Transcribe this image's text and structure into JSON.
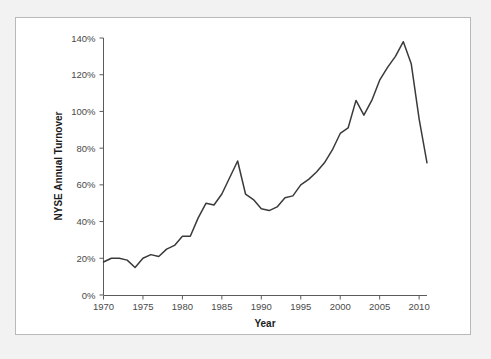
{
  "chart_data": {
    "type": "line",
    "title": "",
    "xlabel": "Year",
    "ylabel": "NYSE Annual Turnover",
    "xlim": [
      1970,
      2011
    ],
    "ylim": [
      0,
      140
    ],
    "grid": false,
    "legend": null,
    "xticks": [
      1970,
      1975,
      1980,
      1985,
      1990,
      1995,
      2000,
      2005,
      2010
    ],
    "xtick_labels": [
      "1970",
      "1975",
      "1980",
      "1985",
      "1990",
      "1995",
      "2000",
      "2005",
      "2010"
    ],
    "yticks": [
      0,
      20,
      40,
      60,
      80,
      100,
      120,
      140
    ],
    "ytick_labels": [
      "0%",
      "20%",
      "40%",
      "60%",
      "80%",
      "100%",
      "120%",
      "140%"
    ],
    "series": [
      {
        "name": "NYSE Annual Turnover",
        "color": "#3a3a3a",
        "x": [
          1970,
          1971,
          1972,
          1973,
          1974,
          1975,
          1976,
          1977,
          1978,
          1979,
          1980,
          1981,
          1982,
          1983,
          1984,
          1985,
          1986,
          1987,
          1988,
          1989,
          1990,
          1991,
          1992,
          1993,
          1994,
          1995,
          1996,
          1997,
          1998,
          1999,
          2000,
          2001,
          2002,
          2003,
          2004,
          2005,
          2006,
          2007,
          2008,
          2009,
          2010,
          2011
        ],
        "values": [
          18,
          20,
          20,
          19,
          15,
          20,
          22,
          21,
          25,
          27,
          32,
          32,
          42,
          50,
          49,
          55,
          64,
          73,
          55,
          52,
          47,
          46,
          48,
          53,
          54,
          60,
          63,
          67,
          72,
          79,
          88,
          91,
          106,
          98,
          106,
          117,
          124,
          130,
          138,
          126,
          96,
          72
        ]
      }
    ]
  },
  "chart": {
    "xlabel": "Year",
    "ylabel": "NYSE Annual Turnover"
  }
}
